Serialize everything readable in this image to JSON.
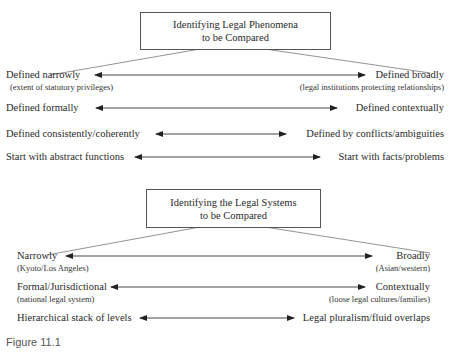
{
  "figure": {
    "caption": "Figure 11.1",
    "sections": [
      {
        "title_line1": "Identifying Legal Phenomena",
        "title_line2": "to be Compared",
        "rows": [
          {
            "left": "Defined narrowly",
            "left_sub": "(extent of statutory privileges)",
            "right": "Defined broadly",
            "right_sub": "(legal institutions protecting relationships)"
          },
          {
            "left": "Defined formally",
            "right": "Defined contextually"
          },
          {
            "left": "Defined consistently/coherently",
            "right": "Defined by conflicts/ambiguities"
          },
          {
            "left": "Start with abstract functions",
            "right": "Start with facts/problems"
          }
        ]
      },
      {
        "title_line1": "Identifying the Legal Systems",
        "title_line2": "to be Compared",
        "rows": [
          {
            "left": "Narrowly",
            "left_sub": "(Kyoto/Los Angeles)",
            "right": "Broadly",
            "right_sub": "(Asian/western)"
          },
          {
            "left": "Formal/Jurisdictional",
            "left_sub": "(national legal system)",
            "right": "Contextually",
            "right_sub": "(loose legal cultures/families)"
          },
          {
            "left": "Hierarchical stack of levels",
            "right": "Legal pluralism/fluid overlaps"
          }
        ]
      }
    ]
  }
}
